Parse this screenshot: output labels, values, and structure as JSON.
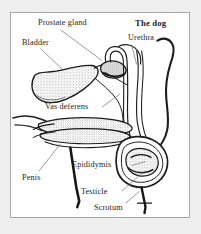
{
  "figure": {
    "title": "The dog",
    "labels": [
      {
        "id": "prostate-gland",
        "text": "Prostate gland"
      },
      {
        "id": "urethra",
        "text": "Urethra"
      },
      {
        "id": "bladder",
        "text": "Bladder"
      },
      {
        "id": "vas-deferens",
        "text": "Vas deferens"
      },
      {
        "id": "epididymis",
        "text": "Epididymis"
      },
      {
        "id": "penis",
        "text": "Penis"
      },
      {
        "id": "testicle",
        "text": "Testicle"
      },
      {
        "id": "scrotum",
        "text": "Scrotum"
      }
    ],
    "colors": {
      "page_background": "#efefef",
      "panel_background": "#ffffff",
      "panel_border": "#a8a8a8",
      "ink": "#1c1c1c",
      "leader_line": "#6f6f6f"
    }
  }
}
